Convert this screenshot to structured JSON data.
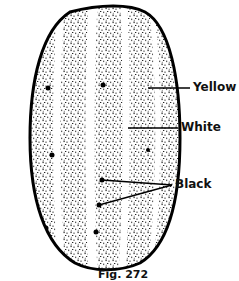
{
  "diagram": {
    "labels": {
      "yellow": "Yellow",
      "white": "White",
      "black": "Black"
    },
    "caption": "Fig. 272"
  }
}
